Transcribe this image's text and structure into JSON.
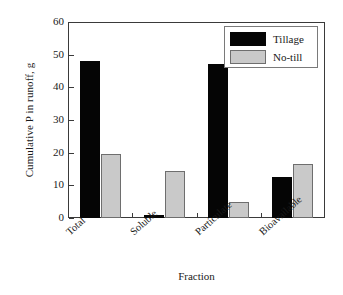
{
  "chart_data": {
    "type": "bar",
    "title": "",
    "xlabel": "Fraction",
    "ylabel": "Cumulative P in runoff, g",
    "categories": [
      "Total",
      "Soluble",
      "Particulate",
      "Bioavailable"
    ],
    "series": [
      {
        "name": "Tillage",
        "color": "#050505",
        "values": [
          48,
          1,
          47,
          12.5
        ]
      },
      {
        "name": "No-till",
        "color": "#c9c9c9",
        "values": [
          19.7,
          14.5,
          5,
          16.5
        ]
      }
    ],
    "ylim": [
      0,
      60
    ],
    "yticks": [
      0,
      10,
      20,
      30,
      40,
      50,
      60
    ],
    "ytick_labels": [
      "0",
      "10",
      "20",
      "30",
      "40",
      "50",
      "60"
    ],
    "grid": false,
    "legend_position": "top-right"
  },
  "axes": {
    "y_title": "Cumulative P in runoff, g",
    "x_title": "Fraction"
  },
  "legend": {
    "entries": [
      {
        "label": "Tillage"
      },
      {
        "label": "No-till"
      }
    ]
  },
  "colors": {
    "tillage": "#050505",
    "notill": "#c9c9c9",
    "axis": "#3a3a3a",
    "background": "#ffffff"
  }
}
